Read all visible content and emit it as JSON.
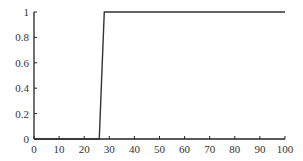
{
  "chart_data": {
    "type": "line",
    "title": "",
    "xlabel": "",
    "ylabel": "",
    "xlim": [
      0,
      100
    ],
    "ylim": [
      0,
      1
    ],
    "grid": false,
    "legend": null,
    "x_ticks": [
      "0",
      "10",
      "20",
      "30",
      "40",
      "50",
      "60",
      "70",
      "80",
      "90",
      "100"
    ],
    "y_ticks": [
      "0",
      "0.2",
      "0.4",
      "0.6",
      "0.8",
      "1"
    ],
    "series": [
      {
        "name": "step",
        "color": "#333333",
        "x": [
          0,
          26,
          28,
          100
        ],
        "y": [
          0,
          0,
          1,
          1
        ]
      }
    ]
  }
}
